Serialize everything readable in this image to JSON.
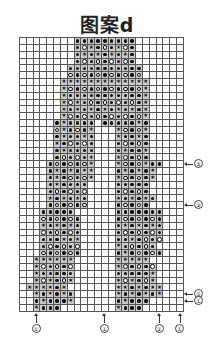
{
  "title": "图案d",
  "legend_symbols": {
    ".": "empty-cell",
    "*": "filled-dot",
    "o": "open-circle",
    "s": "star"
  },
  "chart_data": {
    "type": "table",
    "title": "图案d",
    "columns": 24,
    "rows": 40,
    "grid": [
      "........*********.......",
      "........*os*o*so*.......",
      "........*s*s*s*s*.......",
      "........*o*o*o*o*.......",
      ".......***********......",
      ".......o*o*o*o*o*o......",
      "......sssssssssssss.....",
      "......so*o*o*o*o*os.....",
      "......s***********s.....",
      "......sos*o*o*o*o*s.....",
      "......s*s*s*s*s*s*s.....",
      "......so*o*o*o*o*os.....",
      ".....*s****.*****s*.....",
      ".....os*o*s...so*os.....",
      ".....*s**s*...s**s*.....",
      ".....s*o*o*...*o*o*.....",
      ".....*s****...*s**s.....",
      ".....*o*o*s...so*o*.....",
      "....*o*o*os...so*os**...",
      "....*s*s*ss...*s*s*s....",
      "....*s*o*os...so*o*s....",
      "....*s****....*****.....",
      "....*o*o*o....*o*o*.....",
      "....s*s*s*....s*s*s*....",
      "....*o*o*o....*o*o*.....",
      "...*****......*******...",
      "...o*o*o*.....*o*o*o*...",
      "...s*s*s*.....*s*s*s*...",
      "...o*o*o*.....*o*o*o*...",
      "...***s*s.....**s*o*o...",
      "...*o*o*o.....s*o*o*....",
      "...o*o*o*.....*s*o*o*...",
      "..ssssss......sssss.....",
      "..so*o*o......so*o*o....",
      "..s*****......*****s....",
      "..sos*os......sos*os....",
      ".ssss*s.......ss*s*ss...",
      "..s*s*s*......s*s*s*s...",
      "..*s***s......*s***.....",
      "..s***........s***......"
    ],
    "right_markers": [
      {
        "label": "⑤",
        "row": 18
      },
      {
        "label": "③",
        "row": 24
      },
      {
        "label": "②",
        "row": 37
      },
      {
        "label": "①",
        "row": 38
      }
    ],
    "bottom_markers": [
      {
        "label": "①",
        "col": 2
      },
      {
        "label": "①",
        "col": 12
      },
      {
        "label": "③",
        "col": 20
      },
      {
        "label": "①",
        "col": 23
      }
    ]
  }
}
